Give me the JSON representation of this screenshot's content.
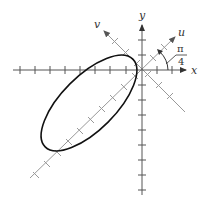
{
  "diagram": {
    "axes": {
      "x_label": "x",
      "y_label": "y",
      "u_label": "u",
      "v_label": "v"
    },
    "angle_label": {
      "numerator": "π",
      "denominator": "4"
    },
    "colors": {
      "axis": "#555555",
      "rotated_axis": "#999999",
      "ellipse": "#111111"
    }
  }
}
